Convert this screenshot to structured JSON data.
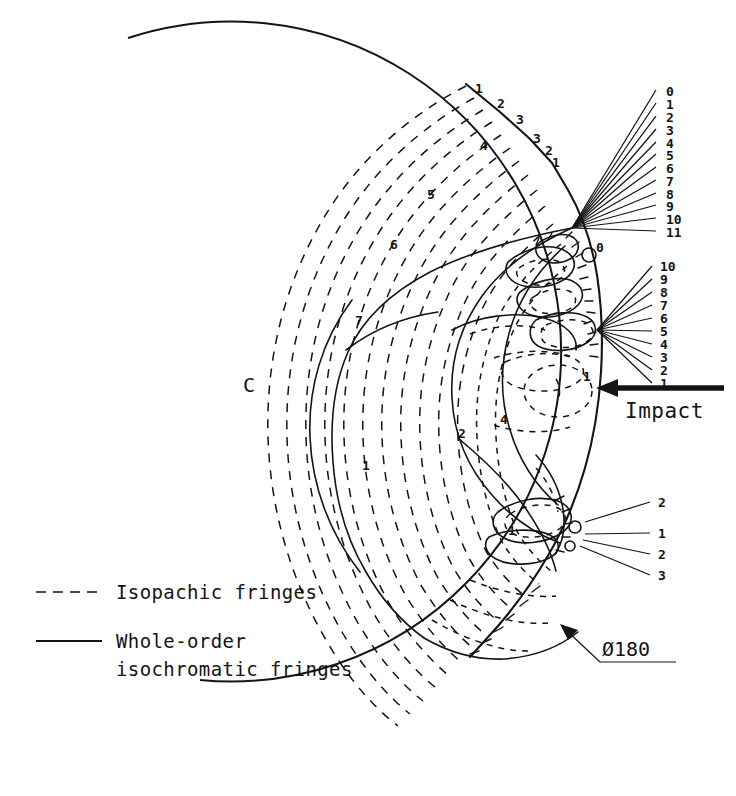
{
  "figure": {
    "center_label": "C",
    "impact_label": "Impact",
    "diameter_label": "Ø180"
  },
  "legend": {
    "items": [
      {
        "style": "dashed",
        "label": "Isopachic fringes"
      },
      {
        "style": "solid",
        "label": "Whole-order"
      },
      {
        "style": "none",
        "label": "isochromatic fringes"
      }
    ],
    "isopachic_label": "Isopachic fringes",
    "isochromatic_label_line1": "Whole-order",
    "isochromatic_label_line2": "isochromatic fringes"
  },
  "callouts": {
    "upper_fan": {
      "name": "upper-leader-fan",
      "origin": {
        "x": 572,
        "y": 228
      },
      "labels": [
        "0",
        "1",
        "2",
        "3",
        "4",
        "5",
        "6",
        "7",
        "8",
        "9",
        "10",
        "11"
      ],
      "label_x": 666,
      "label_y_start": 92,
      "label_y_step": 12.8
    },
    "middle_fan": {
      "name": "middle-leader-fan",
      "origin": {
        "x": 597,
        "y": 330
      },
      "labels": [
        "10",
        "9",
        "8",
        "7",
        "6",
        "5",
        "4",
        "3",
        "2",
        "1"
      ],
      "label_x": 662,
      "label_y_start": 268,
      "label_y_step": 13.2
    },
    "lower_fan": {
      "name": "lower-leader-fan",
      "origin": {
        "x": 585,
        "y": 529
      },
      "labels": [
        "2",
        "1",
        "2",
        "3"
      ],
      "label_x": 660,
      "label_y": [
        504,
        535,
        556,
        577
      ]
    }
  },
  "inline_labels": [
    {
      "text": "1",
      "x": 475,
      "y": 93
    },
    {
      "text": "2",
      "x": 497,
      "y": 108
    },
    {
      "text": "3",
      "x": 516,
      "y": 124
    },
    {
      "text": "4",
      "x": 480,
      "y": 150
    },
    {
      "text": "3",
      "x": 533,
      "y": 143
    },
    {
      "text": "2",
      "x": 545,
      "y": 155
    },
    {
      "text": "1",
      "x": 552,
      "y": 167
    },
    {
      "text": "5",
      "x": 427,
      "y": 199
    },
    {
      "text": "6",
      "x": 390,
      "y": 249
    },
    {
      "text": "0",
      "x": 596,
      "y": 252
    },
    {
      "text": "7",
      "x": 355,
      "y": 325
    },
    {
      "text": "1",
      "x": 583,
      "y": 381
    },
    {
      "text": "4",
      "x": 500,
      "y": 424
    },
    {
      "text": "2",
      "x": 458,
      "y": 438
    },
    {
      "text": "1",
      "x": 362,
      "y": 470
    },
    {
      "text": "1",
      "x": 508,
      "y": 535
    }
  ],
  "colors": {
    "ink": "#141414",
    "background": "#ffffff"
  }
}
